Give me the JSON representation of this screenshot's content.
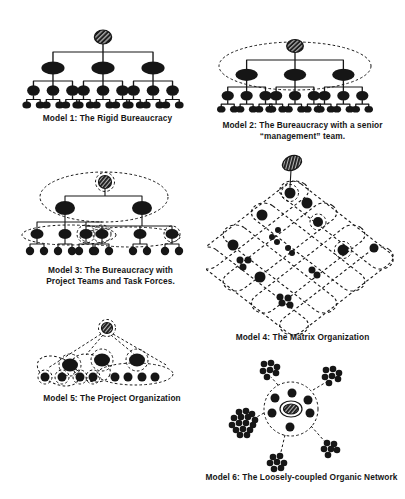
{
  "page": {
    "background": "#ffffff",
    "ink": "#161616"
  },
  "figures": [
    {
      "id": "model-1",
      "caption_lines": [
        "Model 1: The Rigid Bureaucracy"
      ]
    },
    {
      "id": "model-2",
      "caption_lines": [
        "Model 2: The Bureaucracy with a senior",
        "“management” team."
      ]
    },
    {
      "id": "model-3",
      "caption_lines": [
        "Model 3: The Bureaucracy with",
        "Project Teams and Task Forces."
      ]
    },
    {
      "id": "model-4",
      "caption_lines": [
        "Model 4: The Matrix Organization"
      ]
    },
    {
      "id": "model-5",
      "caption_lines": [
        "Model 5: The Project Organization"
      ]
    },
    {
      "id": "model-6",
      "caption_lines": [
        "Model 6: The Loosely-coupled Organic Network"
      ]
    }
  ]
}
